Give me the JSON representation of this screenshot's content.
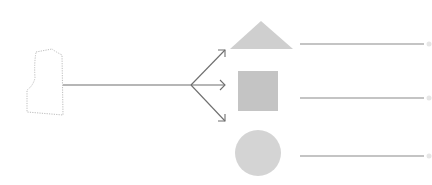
{
  "diagram": {
    "source": {
      "label": "Garment pattern piece (bodice front)",
      "stroke": "#bdbdbd"
    },
    "connector": {
      "stroke": "#6f6f6f",
      "arrow_count": 3
    },
    "shapes": [
      {
        "id": "triangle",
        "label": "Triangle",
        "fill": "#cfcfcf",
        "answer_line": ""
      },
      {
        "id": "square",
        "label": "Square",
        "fill": "#c4c4c4",
        "answer_line": ""
      },
      {
        "id": "circle",
        "label": "Circle",
        "fill": "#d4d4d4",
        "answer_line": ""
      }
    ],
    "answer_line_color": "#8a8a8a"
  }
}
